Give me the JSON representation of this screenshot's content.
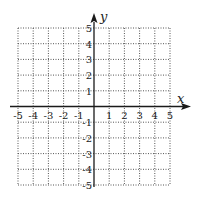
{
  "chart_data": {
    "type": "coordinate-grid",
    "title": "",
    "xlabel": "x",
    "ylabel": "y",
    "xlim": [
      -5,
      5
    ],
    "ylim": [
      -5,
      5
    ],
    "grid": true,
    "grid_style": "dotted",
    "x_ticks": [
      -5,
      -4,
      -3,
      -2,
      -1,
      1,
      2,
      3,
      4,
      5
    ],
    "y_ticks": [
      -5,
      -4,
      -3,
      -2,
      -1,
      1,
      2,
      3,
      4,
      5
    ],
    "x_tick_labels": [
      "-5",
      "-4",
      "-3",
      "-2",
      "-1",
      "1",
      "2",
      "3",
      "4",
      "5"
    ],
    "y_tick_labels": [
      "-5",
      "-4",
      "-3",
      "-2",
      "-1",
      "1",
      "2",
      "3",
      "4",
      "5"
    ],
    "series": []
  },
  "colors": {
    "axis": "#1a1a1a",
    "grid": "#555555",
    "text": "#222222"
  }
}
